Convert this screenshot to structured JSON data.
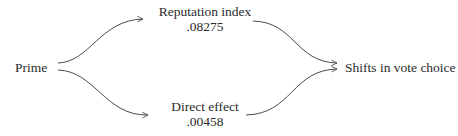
{
  "diagram": {
    "type": "path-diagram",
    "nodes": {
      "source": {
        "label": "Prime"
      },
      "mediator": {
        "label": "Reputation index",
        "value": ".08275"
      },
      "direct": {
        "label": "Direct effect",
        "value": ".00458"
      },
      "outcome": {
        "label": "Shifts in vote choice"
      }
    },
    "edges": [
      {
        "from": "source",
        "to": "mediator"
      },
      {
        "from": "source",
        "to": "direct"
      },
      {
        "from": "mediator",
        "to": "outcome"
      },
      {
        "from": "direct",
        "to": "outcome"
      }
    ],
    "colors": {
      "stroke": "#4a4a4a",
      "text": "#2b2b2b",
      "background": "#ffffff"
    }
  }
}
